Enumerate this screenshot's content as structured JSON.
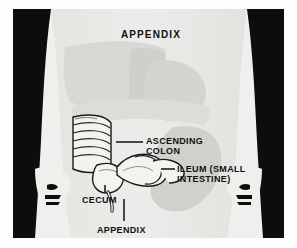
{
  "figure": {
    "title": "APPENDIX",
    "colors": {
      "page_background": "#ffffff",
      "panel_background": "#efefed",
      "silhouette_dark": "#0d0d0d",
      "body_light": "#e9e9e6",
      "organ_grey": "#d2d2cf",
      "organ_grey_dark": "#c2c2bf",
      "intestine_fill": "#f4f4f1",
      "outline": "#111111",
      "label_text": "#101010"
    }
  },
  "labels": [
    {
      "id": "ascending-colon",
      "lines": [
        "ASCENDING",
        "COLON"
      ],
      "leader": "horizontal-line-left"
    },
    {
      "id": "ileum",
      "lines": [
        "ILEUM (SMALL",
        "INTESTINE)"
      ],
      "leader": "horizontal-line-left"
    },
    {
      "id": "cecum",
      "lines": [
        "CECUM"
      ],
      "leader": "vertical-line-up-right"
    },
    {
      "id": "appendix",
      "lines": [
        "APPENDIX"
      ],
      "leader": "vertical-line-up"
    }
  ],
  "anatomy_parts": [
    "torso-silhouette-left-arm",
    "torso-silhouette-right-arm",
    "hand-left",
    "hand-right",
    "liver",
    "stomach",
    "transverse-colon",
    "descending-colon",
    "ascending-colon",
    "cecum",
    "ileum",
    "appendix"
  ]
}
